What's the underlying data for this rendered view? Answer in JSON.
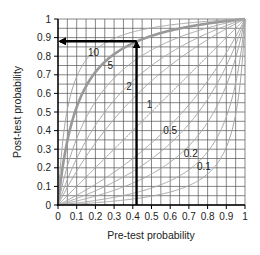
{
  "chart_data": {
    "type": "line",
    "title": "",
    "xlabel": "Pre-test probability",
    "ylabel": "Post-test probability",
    "xlim": [
      0,
      1
    ],
    "ylim": [
      0,
      1
    ],
    "grid": true,
    "grid_minor_step": 0.05,
    "x_ticks": [
      "0",
      "0.1",
      "0.2",
      "0.3",
      "0.4",
      "0.5",
      "0.6",
      "0.7",
      "0.8",
      "0.9",
      "1"
    ],
    "y_ticks": [
      "0",
      "0.1",
      "0.2",
      "0.3",
      "0.4",
      "0.5",
      "0.6",
      "0.7",
      "0.8",
      "0.9",
      "1"
    ],
    "formula": "post = LR*p / (1 - p + LR*p)",
    "series": [
      {
        "name": "10",
        "likelihood_ratio": 10,
        "labeled": true,
        "emphasis": true,
        "label_pos": [
          0.19,
          0.8
        ]
      },
      {
        "name": "5",
        "likelihood_ratio": 5,
        "labeled": true,
        "emphasis": false,
        "label_pos": [
          0.28,
          0.73
        ]
      },
      {
        "name": "2",
        "likelihood_ratio": 2,
        "labeled": true,
        "emphasis": false,
        "label_pos": [
          0.38,
          0.62
        ]
      },
      {
        "name": "1",
        "likelihood_ratio": 1,
        "labeled": true,
        "emphasis": false,
        "label_pos": [
          0.49,
          0.52
        ]
      },
      {
        "name": "0.5",
        "likelihood_ratio": 0.5,
        "labeled": true,
        "emphasis": false,
        "label_pos": [
          0.6,
          0.38
        ]
      },
      {
        "name": "0.2",
        "likelihood_ratio": 0.2,
        "labeled": true,
        "emphasis": false,
        "label_pos": [
          0.71,
          0.26
        ]
      },
      {
        "name": "0.1",
        "likelihood_ratio": 0.1,
        "labeled": true,
        "emphasis": false,
        "label_pos": [
          0.78,
          0.19
        ]
      },
      {
        "name": "20",
        "likelihood_ratio": 20,
        "labeled": false,
        "emphasis": false
      },
      {
        "name": "3",
        "likelihood_ratio": 3,
        "labeled": false,
        "emphasis": false
      },
      {
        "name": "0.33",
        "likelihood_ratio": 0.33,
        "labeled": false,
        "emphasis": false
      },
      {
        "name": "0.05",
        "likelihood_ratio": 0.05,
        "labeled": false,
        "emphasis": false
      }
    ],
    "annotations": [
      {
        "type": "arrow",
        "direction": "up",
        "from": [
          0.42,
          0
        ],
        "to": [
          0.42,
          0.88
        ]
      },
      {
        "type": "arrow",
        "direction": "left",
        "from": [
          0.42,
          0.88
        ],
        "to": [
          0,
          0.88
        ]
      }
    ],
    "colors": {
      "grid": "#555555",
      "curve": "#a6a6a6",
      "curve_emphasis": "#999999",
      "arrow": "#000000",
      "axis": "#000000"
    }
  }
}
